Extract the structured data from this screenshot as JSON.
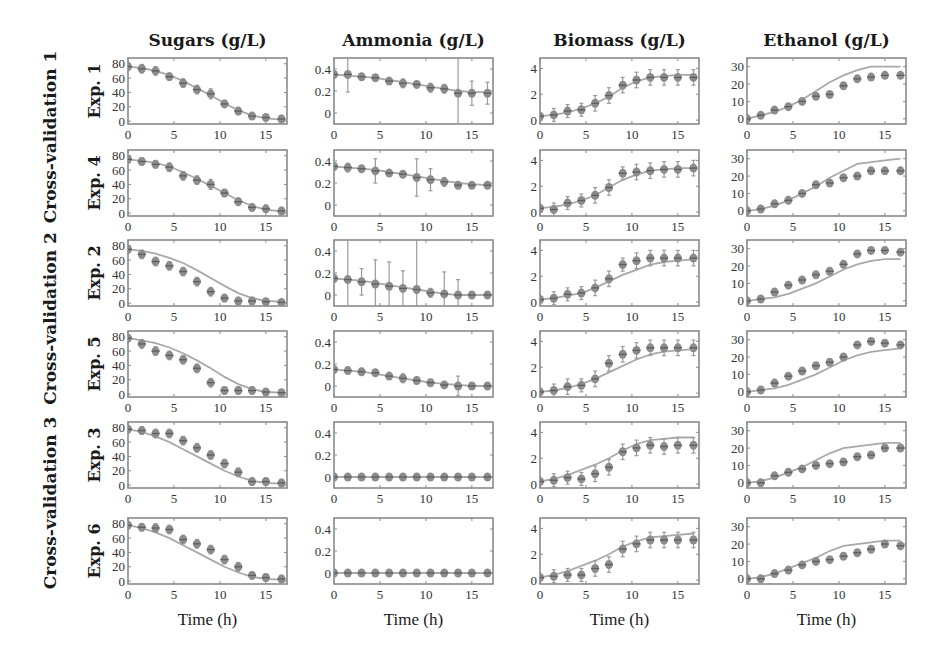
{
  "chart_data": {
    "type": "line",
    "layout": "grid 6 rows x 4 columns of small multiples; experimental data as markers with error bars, model prediction as solid grey line",
    "columns": [
      {
        "key": "sugars",
        "title": "Sugars (g/L)",
        "yticks": [
          0,
          20,
          40,
          60,
          80
        ],
        "ylim": [
          -4,
          88
        ]
      },
      {
        "key": "ammonia",
        "title": "Ammonia (g/L)",
        "yticks": [
          0,
          0.2,
          0.4
        ],
        "ylim": [
          -0.1,
          0.5
        ]
      },
      {
        "key": "biomass",
        "title": "Biomass (g/L)",
        "yticks": [
          0,
          2,
          4
        ],
        "ylim": [
          -0.3,
          4.8
        ]
      },
      {
        "key": "ethanol",
        "title": "Ethanol (g/L)",
        "yticks": [
          0,
          10,
          20,
          30
        ],
        "ylim": [
          -3,
          35
        ]
      }
    ],
    "groups": [
      {
        "label": "Cross-validation 1",
        "rows": [
          0,
          1
        ]
      },
      {
        "label": "Cross-validation 2",
        "rows": [
          2,
          3
        ]
      },
      {
        "label": "Cross-validation 3",
        "rows": [
          4,
          5
        ]
      }
    ],
    "xlabel": "Time (h)",
    "xticks": [
      0,
      5,
      10,
      15
    ],
    "xlim": [
      0,
      17.3
    ],
    "x": [
      0,
      1.5,
      3,
      4.5,
      6,
      7.5,
      9,
      10.5,
      12,
      13.5,
      15,
      16.7
    ],
    "rows": [
      {
        "label": "Exp. 1",
        "sugars": {
          "data": [
            76,
            73,
            70,
            62,
            53,
            44,
            38,
            24,
            14,
            7,
            5,
            3
          ],
          "err": [
            5,
            6,
            6,
            5,
            6,
            6,
            7,
            5,
            5,
            4,
            4,
            5
          ],
          "model": [
            76,
            74,
            70,
            64,
            56,
            46,
            36,
            25,
            15,
            8,
            4,
            2
          ]
        },
        "ammonia": {
          "data": [
            0.35,
            0.35,
            0.33,
            0.32,
            0.29,
            0.27,
            0.26,
            0.23,
            0.22,
            0.18,
            0.18,
            0.18
          ],
          "err": [
            0.02,
            0.16,
            0.02,
            0.02,
            0.03,
            0.04,
            0.03,
            0.04,
            0.04,
            0.5,
            0.11,
            0.1
          ],
          "model": [
            0.35,
            0.34,
            0.33,
            0.32,
            0.3,
            0.28,
            0.26,
            0.24,
            0.22,
            0.2,
            0.19,
            0.19
          ]
        },
        "biomass": {
          "data": [
            0.3,
            0.4,
            0.7,
            0.8,
            1.3,
            1.9,
            2.7,
            3.1,
            3.3,
            3.3,
            3.3,
            3.3
          ],
          "err": [
            0.2,
            0.5,
            0.5,
            0.5,
            0.6,
            0.6,
            0.6,
            0.6,
            0.6,
            0.6,
            0.6,
            0.6
          ],
          "model": [
            0.3,
            0.4,
            0.6,
            0.9,
            1.3,
            1.8,
            2.5,
            3.0,
            3.3,
            3.4,
            3.5,
            3.5
          ]
        },
        "ethanol": {
          "data": [
            0,
            2,
            5,
            7,
            10,
            13,
            14,
            19,
            23,
            24,
            25,
            25
          ],
          "err": [
            1,
            1,
            1,
            1,
            1.5,
            1.5,
            1.5,
            1.5,
            1.5,
            1.5,
            1.5,
            1.5
          ],
          "model": [
            0,
            2,
            4,
            7,
            11,
            16,
            21,
            25,
            28,
            30,
            30,
            30
          ]
        }
      },
      {
        "label": "Exp. 4",
        "sugars": {
          "data": [
            75,
            72,
            68,
            64,
            52,
            46,
            40,
            28,
            16,
            8,
            6,
            3
          ],
          "err": [
            5,
            5,
            5,
            6,
            6,
            6,
            7,
            5,
            5,
            5,
            5,
            5
          ],
          "model": [
            75,
            73,
            70,
            65,
            57,
            48,
            38,
            28,
            18,
            10,
            5,
            2
          ]
        },
        "ammonia": {
          "data": [
            0.35,
            0.34,
            0.33,
            0.31,
            0.29,
            0.28,
            0.25,
            0.23,
            0.21,
            0.18,
            0.18,
            0.18
          ],
          "err": [
            0.02,
            0.04,
            0.02,
            0.11,
            0.02,
            0.03,
            0.17,
            0.1,
            0.04,
            0.03,
            0.02,
            0.02
          ],
          "model": [
            0.35,
            0.34,
            0.33,
            0.32,
            0.3,
            0.28,
            0.26,
            0.24,
            0.22,
            0.2,
            0.19,
            0.18
          ]
        },
        "biomass": {
          "data": [
            0.3,
            0.2,
            0.7,
            0.9,
            1.3,
            1.9,
            3.0,
            3.1,
            3.2,
            3.3,
            3.3,
            3.4
          ],
          "err": [
            0.2,
            0.5,
            0.5,
            0.5,
            0.6,
            0.6,
            0.5,
            0.6,
            0.6,
            0.6,
            0.6,
            0.6
          ],
          "model": [
            0.3,
            0.4,
            0.6,
            0.9,
            1.3,
            1.9,
            2.5,
            2.9,
            3.2,
            3.3,
            3.4,
            3.4
          ]
        },
        "ethanol": {
          "data": [
            0,
            1,
            4,
            6,
            10,
            15,
            16,
            19,
            20,
            23,
            23,
            23
          ],
          "err": [
            1,
            1,
            1,
            1,
            1.5,
            1.5,
            1.5,
            1.5,
            1.5,
            1.5,
            1.5,
            1.5
          ],
          "model": [
            0,
            1,
            3,
            6,
            10,
            14,
            19,
            23,
            27,
            28,
            29,
            30
          ]
        }
      },
      {
        "label": "Exp. 2",
        "sugars": {
          "data": [
            75,
            68,
            58,
            52,
            44,
            30,
            16,
            7,
            3,
            3,
            2,
            1
          ],
          "err": [
            5,
            6,
            6,
            6,
            6,
            6,
            6,
            5,
            5,
            5,
            4,
            4
          ],
          "model": [
            75,
            73,
            69,
            63,
            56,
            46,
            35,
            24,
            14,
            7,
            3,
            2
          ]
        },
        "ammonia": {
          "data": [
            0.15,
            0.14,
            0.12,
            0.1,
            0.08,
            0.06,
            0.05,
            0.02,
            0.01,
            0.0,
            0.0,
            0.0
          ],
          "err": [
            0.02,
            0.5,
            0.12,
            0.22,
            0.22,
            0.16,
            0.5,
            0.04,
            0.2,
            0.14,
            0.03,
            0.03
          ],
          "model": [
            0.15,
            0.14,
            0.13,
            0.11,
            0.09,
            0.07,
            0.05,
            0.03,
            0.01,
            0.0,
            0.0,
            0.0
          ]
        },
        "biomass": {
          "data": [
            0.2,
            0.3,
            0.6,
            0.7,
            1.1,
            1.8,
            2.9,
            3.2,
            3.4,
            3.4,
            3.4,
            3.4
          ],
          "err": [
            0.2,
            0.5,
            0.5,
            0.5,
            0.6,
            0.6,
            0.5,
            0.6,
            0.6,
            0.6,
            0.6,
            0.6
          ],
          "model": [
            0.2,
            0.3,
            0.5,
            0.7,
            1.1,
            1.6,
            2.1,
            2.5,
            2.9,
            3.1,
            3.2,
            3.3
          ]
        },
        "ethanol": {
          "data": [
            0,
            1,
            5,
            9,
            12,
            15,
            17,
            21,
            27,
            29,
            29,
            28
          ],
          "err": [
            1,
            1,
            1.5,
            1.5,
            1.5,
            1.5,
            1.5,
            1.5,
            1.5,
            1.5,
            1.5,
            1.5
          ],
          "model": [
            0,
            1,
            2,
            4,
            7,
            10,
            14,
            18,
            21,
            23,
            24,
            24
          ]
        }
      },
      {
        "label": "Exp. 5",
        "sugars": {
          "data": [
            78,
            70,
            60,
            54,
            48,
            36,
            16,
            5,
            5,
            5,
            3,
            2
          ],
          "err": [
            5,
            6,
            6,
            6,
            6,
            6,
            6,
            5,
            5,
            5,
            4,
            4
          ],
          "model": [
            78,
            75,
            71,
            65,
            57,
            47,
            36,
            24,
            14,
            7,
            3,
            2
          ]
        },
        "ammonia": {
          "data": [
            0.15,
            0.14,
            0.13,
            0.12,
            0.09,
            0.07,
            0.05,
            0.03,
            0.01,
            0.0,
            0.0,
            0.0
          ],
          "err": [
            0.02,
            0.03,
            0.03,
            0.02,
            0.02,
            0.04,
            0.03,
            0.03,
            0.02,
            0.09,
            0.02,
            0.02
          ],
          "model": [
            0.15,
            0.14,
            0.13,
            0.11,
            0.09,
            0.07,
            0.05,
            0.03,
            0.02,
            0.01,
            0.0,
            0.0
          ]
        },
        "biomass": {
          "data": [
            0.1,
            0.2,
            0.5,
            0.6,
            1.1,
            2.3,
            3.0,
            3.3,
            3.5,
            3.5,
            3.5,
            3.5
          ],
          "err": [
            0.2,
            0.5,
            0.6,
            0.5,
            0.6,
            0.6,
            0.6,
            0.6,
            0.6,
            0.6,
            0.6,
            0.6
          ],
          "model": [
            0.1,
            0.2,
            0.4,
            0.7,
            1.1,
            1.6,
            2.1,
            2.6,
            3.0,
            3.2,
            3.3,
            3.4
          ]
        },
        "ethanol": {
          "data": [
            0,
            1,
            5,
            9,
            12,
            15,
            17,
            20,
            27,
            29,
            28,
            27
          ],
          "err": [
            1,
            1,
            1.5,
            1.5,
            1.5,
            1.5,
            1.5,
            1.5,
            1.5,
            1.5,
            1.5,
            1.5
          ],
          "model": [
            0,
            1,
            2,
            4,
            7,
            10,
            14,
            18,
            21,
            23,
            24,
            25
          ]
        }
      },
      {
        "label": "Exp. 3",
        "sugars": {
          "data": [
            78,
            76,
            72,
            72,
            62,
            52,
            42,
            30,
            18,
            5,
            5,
            3
          ],
          "err": [
            5,
            5,
            6,
            6,
            6,
            6,
            6,
            6,
            6,
            5,
            5,
            5
          ],
          "model": [
            78,
            74,
            68,
            60,
            50,
            40,
            30,
            20,
            12,
            6,
            3,
            2
          ]
        },
        "ammonia": {
          "data": [
            0.0,
            0.0,
            0.0,
            0.0,
            0.0,
            0.0,
            0.0,
            0.0,
            0.0,
            0.0,
            0.0,
            0.0
          ],
          "err": [
            0.01,
            0.01,
            0.01,
            0.01,
            0.01,
            0.01,
            0.01,
            0.01,
            0.01,
            0.01,
            0.01,
            0.01
          ],
          "model": [
            0.0,
            0.0,
            0.0,
            0.0,
            0.0,
            0.0,
            0.0,
            0.0,
            0.0,
            0.0,
            0.0,
            0.0
          ]
        },
        "biomass": {
          "data": [
            0.2,
            0.3,
            0.5,
            0.4,
            0.8,
            1.3,
            2.5,
            2.8,
            3.0,
            2.9,
            3.0,
            3.0
          ],
          "err": [
            0.2,
            0.5,
            0.5,
            0.5,
            0.6,
            0.6,
            0.6,
            0.6,
            0.6,
            0.6,
            0.6,
            0.6
          ],
          "model": [
            0.2,
            0.4,
            0.7,
            1.1,
            1.5,
            2.0,
            2.6,
            3.1,
            3.4,
            3.5,
            3.6,
            3.6
          ]
        },
        "ethanol": {
          "data": [
            0,
            0,
            4,
            6,
            8,
            10,
            11,
            12,
            15,
            16,
            20,
            20
          ],
          "err": [
            1,
            1,
            1.5,
            1.5,
            1.5,
            1.5,
            1.5,
            1.5,
            1.5,
            1.5,
            1.5,
            1.5
          ],
          "model": [
            0,
            1,
            3,
            6,
            9,
            13,
            17,
            20,
            21,
            22,
            23,
            23
          ]
        }
      },
      {
        "label": "Exp. 6",
        "sugars": {
          "data": [
            78,
            75,
            74,
            72,
            58,
            52,
            44,
            30,
            20,
            8,
            5,
            3
          ],
          "err": [
            5,
            5,
            6,
            6,
            6,
            6,
            6,
            6,
            6,
            5,
            5,
            5
          ],
          "model": [
            78,
            74,
            68,
            60,
            50,
            40,
            30,
            20,
            12,
            6,
            3,
            2
          ]
        },
        "ammonia": {
          "data": [
            0.0,
            0.0,
            0.0,
            0.0,
            0.0,
            0.0,
            0.0,
            0.0,
            0.0,
            0.0,
            0.0,
            0.0
          ],
          "err": [
            0.01,
            0.01,
            0.01,
            0.01,
            0.01,
            0.01,
            0.01,
            0.01,
            0.01,
            0.01,
            0.01,
            0.01
          ],
          "model": [
            0.0,
            0.0,
            0.0,
            0.0,
            0.0,
            0.0,
            0.0,
            0.0,
            0.0,
            0.0,
            0.0,
            0.0
          ]
        },
        "biomass": {
          "data": [
            0.2,
            0.3,
            0.4,
            0.4,
            0.9,
            1.2,
            2.4,
            2.8,
            3.1,
            3.1,
            3.1,
            3.1
          ],
          "err": [
            0.2,
            0.5,
            0.5,
            0.5,
            0.6,
            0.6,
            0.6,
            0.6,
            0.6,
            0.6,
            0.6,
            0.6
          ],
          "model": [
            0.2,
            0.4,
            0.7,
            1.1,
            1.5,
            2.0,
            2.6,
            3.0,
            3.3,
            3.4,
            3.5,
            3.6
          ]
        },
        "ethanol": {
          "data": [
            0,
            0,
            3,
            5,
            8,
            10,
            11,
            13,
            15,
            17,
            20,
            19
          ],
          "err": [
            1,
            1,
            1.5,
            1.5,
            1.5,
            1.5,
            1.5,
            1.5,
            1.5,
            1.5,
            1.5,
            1.5
          ],
          "model": [
            0,
            1,
            3,
            6,
            9,
            12,
            16,
            19,
            20,
            21,
            22,
            22
          ]
        }
      }
    ]
  },
  "figure": {
    "colors": {
      "frame": "#8a8a8a",
      "model": "#a9a9a9",
      "marker": "#8c8c8c",
      "marker_core": "#5e5e5e",
      "errorbar": "#9a9a9a"
    }
  }
}
